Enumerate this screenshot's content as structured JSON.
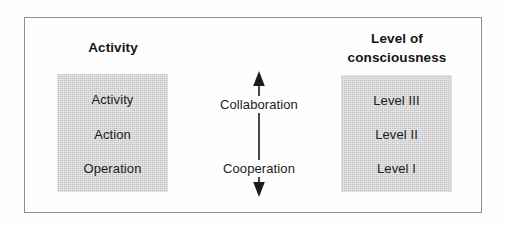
{
  "figure": {
    "frame_color": "#8e8e8e",
    "box_fill_color": "#d4d4d4",
    "text_color": "#1b1b1b",
    "background_color": "#fefefe"
  },
  "columns": {
    "left": {
      "heading": "Activity",
      "items": [
        "Activity",
        "Action",
        "Operation"
      ]
    },
    "right": {
      "heading": "Level of\nconsciousness",
      "items": [
        "Level III",
        "Level II",
        "Level I"
      ]
    }
  },
  "center": {
    "upper_label": "Collaboration",
    "lower_label": "Cooperation",
    "arrow_type": "double-headed-vertical-arrow",
    "arrow_up_icon": "arrow-up-icon",
    "arrow_down_icon": "arrow-down-icon"
  }
}
